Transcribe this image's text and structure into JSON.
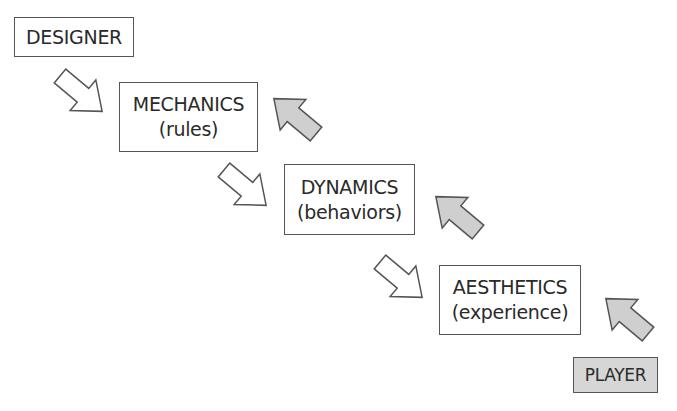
{
  "diagram": {
    "nodes": [
      {
        "id": "designer",
        "label": "DESIGNER"
      },
      {
        "id": "mechanics",
        "label": "MECHANICS",
        "sub": "(rules)"
      },
      {
        "id": "dynamics",
        "label": "DYNAMICS",
        "sub": "(behaviors)"
      },
      {
        "id": "aesthetics",
        "label": "AESTHETICS",
        "sub": "(experience)"
      },
      {
        "id": "player",
        "label": "PLAYER"
      }
    ],
    "edges": [
      {
        "from": "designer",
        "to": "mechanics",
        "style": "white-arrow"
      },
      {
        "from": "mechanics",
        "to": "dynamics",
        "style": "white-arrow"
      },
      {
        "from": "dynamics",
        "to": "aesthetics",
        "style": "white-arrow"
      },
      {
        "from": "player",
        "to": "aesthetics",
        "style": "grey-arrow"
      },
      {
        "from": "aesthetics",
        "to": "dynamics",
        "style": "grey-arrow"
      },
      {
        "from": "dynamics",
        "to": "mechanics",
        "style": "grey-arrow"
      }
    ],
    "colors": {
      "white_arrow": "#ffffff",
      "grey_arrow": "#cfcfcf",
      "player_box": "#d6d6d6",
      "stroke": "#555555"
    }
  }
}
